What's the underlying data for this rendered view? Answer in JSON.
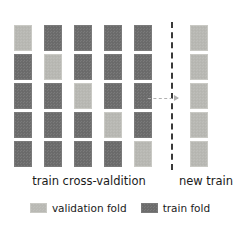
{
  "diagram": {
    "title": "",
    "colors": {
      "validation_fold": "#b9b9b4",
      "train_fold": "#6c6c6c",
      "divider": "#3a3a3a",
      "arrow": "#b0b0b0",
      "text": "#1a1a1a",
      "background": "#ffffff"
    },
    "layout": {
      "n_folds": 5,
      "n_cv_columns": 5,
      "n_new_train_columns": 1,
      "block_width": 18,
      "block_height": 26,
      "row_gap": 3,
      "column_gap": 12,
      "grid_left": 14,
      "grid_top": 25,
      "divider_x": 171,
      "divider_top": 22,
      "divider_height": 148,
      "new_train_left": 190
    },
    "cv_columns": [
      {
        "index": 1,
        "validation_row": 1,
        "folds": [
          "validation",
          "train",
          "train",
          "train",
          "train"
        ]
      },
      {
        "index": 2,
        "validation_row": 2,
        "folds": [
          "train",
          "validation",
          "train",
          "train",
          "train"
        ]
      },
      {
        "index": 3,
        "validation_row": 3,
        "folds": [
          "train",
          "train",
          "validation",
          "train",
          "train"
        ]
      },
      {
        "index": 4,
        "validation_row": 4,
        "folds": [
          "train",
          "train",
          "train",
          "validation",
          "train"
        ]
      },
      {
        "index": 5,
        "validation_row": 5,
        "folds": [
          "train",
          "train",
          "train",
          "train",
          "validation"
        ]
      }
    ],
    "new_train_column": {
      "index": 6,
      "folds": [
        "validation",
        "validation",
        "validation",
        "validation",
        "validation"
      ]
    },
    "arrow": {
      "name": "transfer-arrow",
      "style": "dashed",
      "direction": "right",
      "x": 148,
      "y": 98,
      "length": 30
    },
    "captions": {
      "left": "train cross-valdition",
      "left_x": 14,
      "left_width": 150,
      "left_y": 174,
      "right": "new train",
      "right_x": 176,
      "right_width": 60,
      "right_y": 174
    },
    "legend": {
      "y": 202,
      "entries": [
        {
          "label": "validation fold",
          "swatch": "validation",
          "icon": "validation-fold-swatch-icon"
        },
        {
          "label": "train fold",
          "swatch": "train",
          "icon": "train-fold-swatch-icon"
        }
      ]
    }
  }
}
